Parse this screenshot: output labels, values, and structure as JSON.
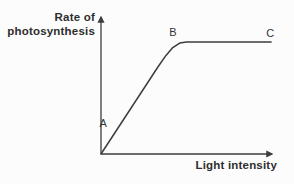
{
  "colors": {
    "background": "#fcfcfc",
    "line": "#3d3d3d",
    "text": "#2e2e2e"
  },
  "chart_data": {
    "type": "line",
    "title": "",
    "xlabel": "Light intensity",
    "ylabel": "Rate of photosynthesis",
    "ylabel_lines": [
      "Rate of",
      "photosynthesis"
    ],
    "x_axis": {
      "range": [
        0,
        1
      ],
      "ticks": [],
      "arrow": true
    },
    "y_axis": {
      "range": [
        0,
        1
      ],
      "ticks": [],
      "arrow": true
    },
    "grid": false,
    "legend": false,
    "series": [
      {
        "name": "photosynthesis-rate",
        "points": [
          {
            "x": 0.0,
            "y": 0.0
          },
          {
            "x": 0.333,
            "y": 0.777
          },
          {
            "x": 0.38,
            "y": 0.88
          },
          {
            "x": 0.42,
            "y": 0.95
          },
          {
            "x": 0.46,
            "y": 0.99
          },
          {
            "x": 0.5,
            "y": 1.0
          },
          {
            "x": 0.995,
            "y": 1.0
          }
        ]
      }
    ],
    "annotations": [
      {
        "label": "A",
        "x": 0.12,
        "y": 0.24,
        "label_x": 0.013,
        "label_y": 0.27,
        "description": "light-limited linear region"
      },
      {
        "label": "B",
        "x": 0.48,
        "y": 1.0,
        "label_x": 0.42,
        "label_y": 1.08,
        "description": "start of plateau"
      },
      {
        "label": "C",
        "x": 0.98,
        "y": 1.0,
        "label_x": 0.99,
        "label_y": 1.07,
        "description": "light-saturated plateau"
      }
    ]
  }
}
